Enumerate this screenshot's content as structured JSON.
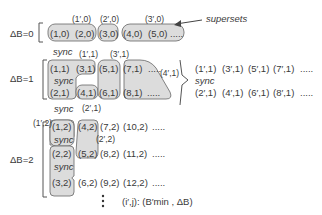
{
  "labels": {
    "supersets": "supersets",
    "sync": "sync",
    "db0": "ΔB=0",
    "db1": "ΔB=1",
    "db2": "ΔB=2",
    "legend": "(i′,j): (B′min , ΔB)"
  },
  "row0": {
    "cells": [
      "(1,0)",
      "(2,0)",
      "(3,0)",
      "(4,0)",
      "(5,0)",
      "....."
    ],
    "groups": [
      "(1′,0)",
      "(2′,0)",
      "(3′,0)"
    ]
  },
  "row1": {
    "top": [
      "(1,1)",
      "(3,1)",
      "(5,1)",
      "(7,1)",
      "....."
    ],
    "bottom": [
      "(2,1)",
      "(4,1)",
      "(6,1)",
      "(8,1)",
      "....."
    ],
    "groups": [
      "(1′,1)",
      "(3′,1)",
      "(4′,1)",
      "(2′,1)"
    ],
    "right_top": [
      "(1′,1)",
      "(3′,1)",
      "(5′,1)",
      "(7′,1)",
      "....."
    ],
    "right_bottom": [
      "(2′,1)",
      "(4′,1)",
      "(6′,1)",
      "(8′,1)",
      "....."
    ]
  },
  "row2": {
    "r1": [
      "(1,2)",
      "(4,2)",
      "(7,2)",
      "(10,2)",
      "....."
    ],
    "r2": [
      "(2,2)",
      "(5,2)",
      "(8,2)",
      "(11,2)",
      "....."
    ],
    "r3": [
      "(3,2)",
      "(6,2)",
      "(9,2)",
      "(12,2)",
      "....."
    ],
    "groups": [
      "(1′,2)",
      "(2′,2)"
    ]
  }
}
